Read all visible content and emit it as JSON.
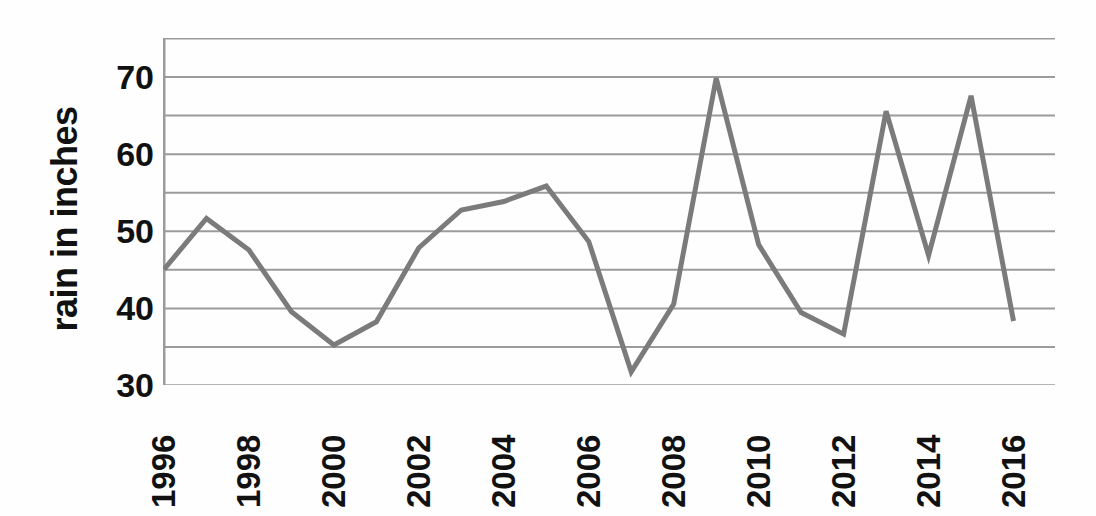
{
  "chart_data": {
    "type": "line",
    "title": "",
    "xlabel": "",
    "ylabel": "rain in inches",
    "x": [
      1996,
      1997,
      1998,
      1999,
      2000,
      2001,
      2002,
      2003,
      2004,
      2005,
      2006,
      2007,
      2008,
      2009,
      2010,
      2011,
      2012,
      2013,
      2014,
      2015,
      2016
    ],
    "values": [
      45.0,
      51.6,
      47.5,
      39.5,
      35.2,
      38.2,
      47.8,
      52.7,
      53.8,
      55.8,
      48.6,
      31.7,
      40.5,
      69.8,
      48.2,
      39.4,
      36.6,
      65.5,
      46.8,
      67.5,
      38.3
    ],
    "series": [
      {
        "name": "rainfall",
        "values": [
          45.0,
          51.6,
          47.5,
          39.5,
          35.2,
          38.2,
          47.8,
          52.7,
          53.8,
          55.8,
          48.6,
          31.7,
          40.5,
          69.8,
          48.2,
          39.4,
          36.6,
          65.5,
          46.8,
          67.5,
          38.3
        ]
      }
    ],
    "xlim": [
      1996,
      2017
    ],
    "ylim": [
      30,
      75
    ],
    "y_ticks": [
      30,
      35,
      40,
      45,
      50,
      55,
      60,
      65,
      70,
      75
    ],
    "y_tick_labels": [
      "30",
      "",
      "40",
      "",
      "50",
      "",
      "60",
      "",
      "70",
      ""
    ],
    "x_tick_labels": [
      "1996",
      "",
      "1998",
      "",
      "2000",
      "",
      "2002",
      "",
      "2004",
      "",
      "2006",
      "",
      "2008",
      "",
      "2010",
      "",
      "2012",
      "",
      "2014",
      "",
      "2016"
    ],
    "grid": true,
    "grid_axis": "y",
    "legend": "none",
    "line_color": "#7b7b7b",
    "grid_color": "#9b9b9b",
    "axis_color": "#9b9b9b",
    "text_color": "#111111",
    "line_width": 5
  }
}
